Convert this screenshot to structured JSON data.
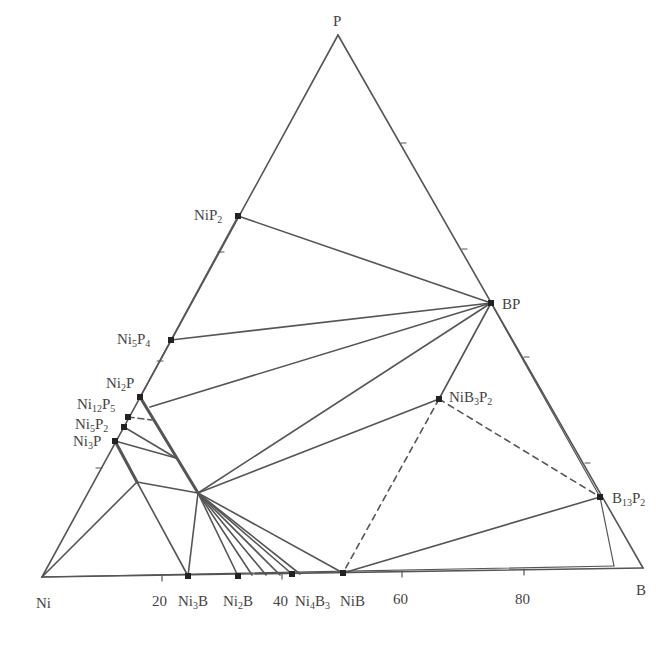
{
  "diagram": {
    "type": "ternary phase diagram",
    "corners": {
      "P": {
        "label": "P",
        "x": 338,
        "y": 35
      },
      "Ni": {
        "label": "Ni",
        "x": 42,
        "y": 577
      },
      "B": {
        "label": "B",
        "x": 643,
        "y": 568
      }
    },
    "axis_ticks": [
      {
        "label": "20",
        "x": 162,
        "y": 573
      },
      {
        "label": "40",
        "x": 282,
        "y": 572
      },
      {
        "label": "60",
        "x": 402,
        "y": 571
      },
      {
        "label": "80",
        "x": 524,
        "y": 570
      }
    ],
    "phases": [
      {
        "id": "NiP2",
        "label": "NiP2",
        "x": 238,
        "y": 216
      },
      {
        "id": "Ni5P4",
        "label": "Ni5P4",
        "x": 171,
        "y": 340
      },
      {
        "id": "Ni2P",
        "label": "Ni2P",
        "x": 140,
        "y": 397
      },
      {
        "id": "Ni12P5",
        "label": "Ni12P5",
        "x": 128,
        "y": 417
      },
      {
        "id": "Ni5P2",
        "label": "Ni5P2",
        "x": 124,
        "y": 427
      },
      {
        "id": "Ni3P",
        "label": "Ni3P",
        "x": 115,
        "y": 441
      },
      {
        "id": "BP",
        "label": "BP",
        "x": 491,
        "y": 303
      },
      {
        "id": "NiB3P2",
        "label": "NiB3P2",
        "x": 439,
        "y": 399
      },
      {
        "id": "B13P2",
        "label": "B13P2",
        "x": 600,
        "y": 497
      },
      {
        "id": "Ni3B",
        "label": "Ni3B",
        "x": 188,
        "y": 576
      },
      {
        "id": "Ni2B",
        "label": "Ni2B",
        "x": 238,
        "y": 576
      },
      {
        "id": "Ni4B3",
        "label": "Ni4B3",
        "x": 292,
        "y": 574
      },
      {
        "id": "NiB",
        "label": "NiB",
        "x": 343,
        "y": 573
      }
    ],
    "labels": {
      "P": "P",
      "Ni": "Ni",
      "B": "B",
      "t20": "20",
      "t40": "40",
      "t60": "60",
      "t80": "80",
      "NiP2": {
        "base1": "NiP",
        "sub1": "2"
      },
      "Ni5P4": {
        "base1": "Ni",
        "sub1": "5",
        "base2": "P",
        "sub2": "4"
      },
      "Ni2P": {
        "base1": "Ni",
        "sub1": "2",
        "base2": "P"
      },
      "Ni12P5": {
        "base1": "Ni",
        "sub1": "12",
        "base2": "P",
        "sub2": "5"
      },
      "Ni5P2": {
        "base1": "Ni",
        "sub1": "5",
        "base2": "P",
        "sub2": "2"
      },
      "Ni3P": {
        "base1": "Ni",
        "sub1": "3",
        "base2": "P"
      },
      "BP": "BP",
      "NiB3P2": {
        "base1": "NiB",
        "sub1": "3",
        "base2": "P",
        "sub2": "2"
      },
      "B13P2": {
        "base1": "B",
        "sub1": "13",
        "base2": "P",
        "sub2": "2"
      },
      "Ni3B": {
        "base1": "Ni",
        "sub1": "3",
        "base2": "B"
      },
      "Ni2B": {
        "base1": "Ni",
        "sub1": "2",
        "base2": "B"
      },
      "Ni4B3": {
        "base1": "Ni",
        "sub1": "4",
        "base2": "B",
        "sub2": "3"
      },
      "NiB": "NiB"
    },
    "line_color": "#555555",
    "tie_lines_note": "solid lines = tie lines; dashed lines = tentative tie lines from NiB3P2"
  }
}
